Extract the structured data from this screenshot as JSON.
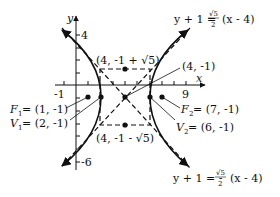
{
  "figure": {
    "type": "hyperbola-graph",
    "axes": {
      "x_label": "x",
      "y_label": "y",
      "x_tick_labels": [
        "-1",
        "9"
      ],
      "y_tick_labels": [
        "4",
        "-6"
      ]
    },
    "center": {
      "label": "(4, -1)",
      "x": 4,
      "y": -1
    },
    "box_top_point": {
      "label": "(4, -1 + √5)"
    },
    "box_bottom_point": {
      "label": "(4, -1 - √5)"
    },
    "foci": [
      {
        "name": "F",
        "sub": "1",
        "label": " = (1, -1)",
        "x": 1,
        "y": -1
      },
      {
        "name": "F",
        "sub": "2",
        "label": " = (7, -1)",
        "x": 7,
        "y": -1
      }
    ],
    "vertices": [
      {
        "name": "V",
        "sub": "1",
        "label": " = (2, -1)",
        "x": 2,
        "y": -1
      },
      {
        "name": "V",
        "sub": "2",
        "label": " = (6, -1)",
        "x": 6,
        "y": -1
      }
    ],
    "asymptotes": [
      {
        "lhs": "y + 1 = ",
        "num": "√5",
        "den": "2",
        "rhs": "(x - 4)",
        "sign": ""
      },
      {
        "lhs": "y + 1 = -",
        "num": "√5",
        "den": "2",
        "rhs": "(x -  4)",
        "sign": "-"
      }
    ]
  }
}
